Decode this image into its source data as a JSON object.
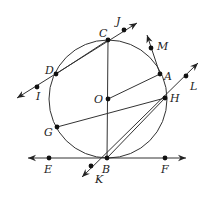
{
  "diagram": {
    "type": "circle-geometry",
    "circle": {
      "center": "O",
      "cx": 108,
      "cy": 99,
      "r": 59
    },
    "points": [
      {
        "name": "C",
        "x": 108,
        "y": 40,
        "label_x": 99,
        "label_y": 37
      },
      {
        "name": "J",
        "x": 124,
        "y": 30,
        "label_x": 116,
        "label_y": 25
      },
      {
        "name": "M",
        "x": 151,
        "y": 48,
        "label_x": 157,
        "label_y": 50
      },
      {
        "name": "D",
        "x": 56,
        "y": 74,
        "label_x": 45,
        "label_y": 74
      },
      {
        "name": "I",
        "x": 37,
        "y": 87,
        "label_x": 36,
        "label_y": 100
      },
      {
        "name": "A",
        "x": 160,
        "y": 74,
        "label_x": 164,
        "label_y": 80
      },
      {
        "name": "L",
        "x": 186,
        "y": 76,
        "label_x": 190,
        "label_y": 90
      },
      {
        "name": "O",
        "x": 108,
        "y": 99,
        "label_x": 94,
        "label_y": 103
      },
      {
        "name": "H",
        "x": 165,
        "y": 98,
        "label_x": 170,
        "label_y": 102
      },
      {
        "name": "G",
        "x": 57,
        "y": 127,
        "label_x": 44,
        "label_y": 136
      },
      {
        "name": "B",
        "x": 107,
        "y": 158,
        "label_x": 102,
        "label_y": 173
      },
      {
        "name": "E",
        "x": 49,
        "y": 158,
        "label_x": 44,
        "label_y": 173
      },
      {
        "name": "F",
        "x": 165,
        "y": 158,
        "label_x": 161,
        "label_y": 173
      },
      {
        "name": "K",
        "x": 91,
        "y": 166,
        "label_x": 95,
        "label_y": 183
      }
    ],
    "segments": [
      {
        "name": "diameter-CB",
        "from": "C",
        "to": "B"
      },
      {
        "name": "chord-CD",
        "from": "C",
        "to": "D"
      },
      {
        "name": "radius-OA",
        "from": "O",
        "to": "A"
      },
      {
        "name": "chord-GH",
        "from": "G",
        "to": "H"
      },
      {
        "name": "chord-BH",
        "from": "B",
        "to": "H"
      }
    ],
    "rays_and_lines": [
      {
        "name": "secant-IJ",
        "x1": 17,
        "y1": 98,
        "x2": 137,
        "y2": 23,
        "arrows": "both"
      },
      {
        "name": "ray-AM",
        "x1": 160,
        "y1": 74,
        "x2": 147,
        "y2": 35,
        "arrows": "end"
      },
      {
        "name": "secant-KL",
        "x1": 82,
        "y1": 177,
        "x2": 198,
        "y2": 63,
        "arrows": "both"
      },
      {
        "name": "tangent-EF",
        "x1": 28,
        "y1": 158,
        "x2": 186,
        "y2": 158,
        "arrows": "both"
      }
    ]
  }
}
